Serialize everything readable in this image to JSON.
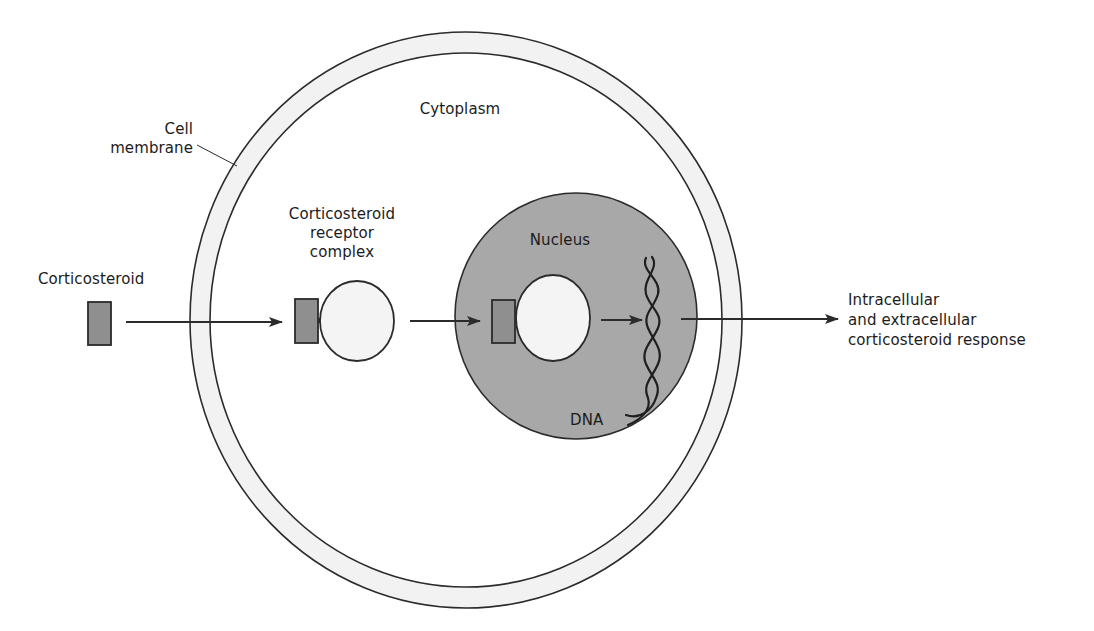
{
  "diagram": {
    "type": "biological-pathway",
    "labels": {
      "cell_membrane": [
        "Cell",
        "membrane"
      ],
      "cytoplasm": "Cytoplasm",
      "corticosteroid": "Corticosteroid",
      "receptor_complex": [
        "Corticosteroid",
        "receptor",
        "complex"
      ],
      "nucleus": "Nucleus",
      "dna": "DNA",
      "response": [
        "Intracellular",
        "and extracellular",
        "corticosteroid response"
      ]
    },
    "colors": {
      "outline": "#2b2b2b",
      "membrane_fill": "#f2f2f2",
      "nucleus_fill": "#a8a8a8",
      "steroid_fill": "#8f8f8f",
      "receptor_fill": "#f4f4f4",
      "background": "#ffffff"
    },
    "flow": [
      "Corticosteroid",
      "Corticosteroid receptor complex",
      "Nucleus (receptor complex binds)",
      "DNA",
      "Intracellular and extracellular corticosteroid response"
    ]
  }
}
